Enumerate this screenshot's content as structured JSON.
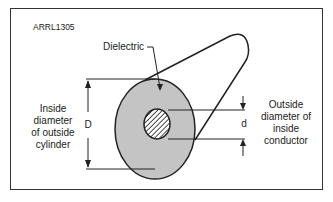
{
  "figure": {
    "id_label": "ARRL1305",
    "dielectric_label": "Dielectric",
    "outer_label": "Inside diameter of outside cylinder",
    "outer_lines": [
      "Inside",
      "diameter",
      "of outside",
      "cylinder"
    ],
    "outer_symbol": "D",
    "inner_lines": [
      "Outside",
      "diameter of",
      "inside",
      "conductor"
    ],
    "inner_symbol": "d",
    "colors": {
      "dielectric_fill": "#c4c4c4",
      "outline": "#222222",
      "frame": "#333333"
    }
  }
}
